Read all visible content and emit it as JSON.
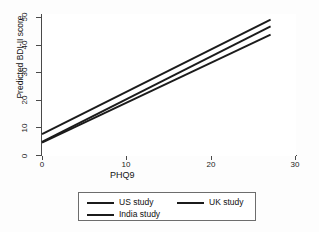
{
  "chart_data": {
    "type": "line",
    "title": "",
    "xlabel": "PHQ9",
    "ylabel": "Predicted BDI-II score",
    "xlim": [
      0,
      30
    ],
    "ylim": [
      0,
      53
    ],
    "xticks": [
      0,
      10,
      20,
      30
    ],
    "yticks": [
      0,
      10,
      20,
      30,
      40,
      50
    ],
    "grid": false,
    "legend_position": "bottom",
    "series": [
      {
        "name": "US study",
        "x": [
          0,
          27
        ],
        "y": [
          8.2,
          50.9
        ]
      },
      {
        "name": "UK study",
        "x": [
          0,
          27
        ],
        "y": [
          5.3,
          48.4
        ]
      },
      {
        "name": "India study",
        "x": [
          0,
          27
        ],
        "y": [
          5.0,
          45.3
        ]
      }
    ],
    "line_color": "#1b1b1b"
  },
  "axes": {
    "y_tick_labels": [
      "0",
      "10",
      "20",
      "30",
      "40",
      "50"
    ],
    "x_tick_labels": [
      "0",
      "10",
      "20",
      "30"
    ],
    "y_title": "Predicted BDI-II score",
    "x_title": "PHQ9"
  },
  "legend": {
    "items": [
      {
        "label": "US study"
      },
      {
        "label": "UK study"
      },
      {
        "label": "India study"
      }
    ]
  }
}
